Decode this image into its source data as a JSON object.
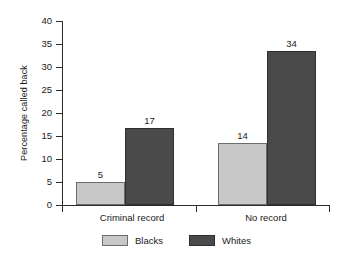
{
  "chart_data": {
    "type": "bar",
    "title": "",
    "subtitle": "",
    "xlabel": "",
    "ylabel": "Percentage called back",
    "categories": [
      "Criminal record",
      "No record"
    ],
    "series": [
      {
        "name": "Blacks",
        "color": "#c8c8c8",
        "values": [
          5,
          14
        ]
      },
      {
        "name": "Whites",
        "color": "#4a4a4a",
        "values": [
          17,
          34
        ]
      }
    ],
    "value_labels": [
      [
        "5",
        "17"
      ],
      [
        "14",
        "34"
      ]
    ],
    "ylim": [
      0,
      40
    ],
    "yticks": [
      0,
      5,
      10,
      15,
      20,
      25,
      30,
      35,
      40
    ],
    "ytick_labels": [
      "0",
      "5",
      "10",
      "15",
      "20",
      "25",
      "30",
      "35",
      "40"
    ],
    "grid": false,
    "legend_position": "bottom-center",
    "legend_entries": [
      "Blacks",
      "Whites"
    ],
    "bar_plot_heights": [
      [
        5.0,
        16.7
      ],
      [
        13.5,
        33.5
      ]
    ]
  },
  "axes": {
    "y_title": "Percentage called back"
  },
  "legend": {
    "items": [
      {
        "label": "Blacks"
      },
      {
        "label": "Whites"
      }
    ]
  }
}
